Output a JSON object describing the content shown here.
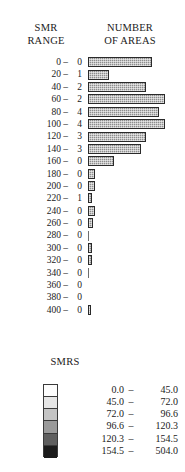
{
  "header": {
    "smr_range_line1": "SMR",
    "smr_range_line2": "RANGE",
    "number_areas_line1": "NUMBER",
    "number_areas_line2": "OF AREAS"
  },
  "legend": {
    "title": "SMRS",
    "entries": [
      {
        "low": "0.0",
        "dash": "–",
        "high": "45.0",
        "color": "#fdfdfd"
      },
      {
        "low": "45.0",
        "dash": "–",
        "high": "72.0",
        "color": "#e6e6e6"
      },
      {
        "low": "72.0",
        "dash": "–",
        "high": "96.6",
        "color": "#c4c4c4"
      },
      {
        "low": "96.6",
        "dash": "–",
        "high": "120.3",
        "color": "#9a9a9a"
      },
      {
        "low": "120.3",
        "dash": "–",
        "high": "154.5",
        "color": "#5f5f5f"
      },
      {
        "low": "154.5",
        "dash": "–",
        "high": "504.0",
        "color": "#1c1c1c"
      }
    ]
  },
  "chart_data": {
    "type": "bar",
    "title": "NUMBER OF AREAS",
    "xlabel": "NUMBER OF AREAS",
    "ylabel": "SMR RANGE",
    "orientation": "horizontal",
    "grid": false,
    "legend_position": "bottom",
    "categories": [
      "0 –",
      "20 –",
      "40 –",
      "60 –",
      "80 –",
      "100 –",
      "120 –",
      "140 –",
      "160 –",
      "180 –",
      "200 –",
      "220 –",
      "240 –",
      "260 –",
      "280 –",
      "300 –",
      "320 –",
      "340 –",
      "360 –",
      "380 –",
      "400 –"
    ],
    "count_labels": [
      "0",
      "1",
      "2",
      "2",
      "4",
      "4",
      "3",
      "3",
      "0",
      "0",
      "0",
      "1",
      "0",
      "0",
      "0",
      "0",
      "0",
      "0",
      "0",
      "0",
      "0"
    ],
    "bar_lengths_px": [
      64,
      21,
      58,
      77,
      71,
      77,
      58,
      53,
      26,
      7,
      7,
      4,
      7,
      5,
      1,
      4,
      4,
      1,
      0,
      0,
      3
    ],
    "rows": [
      {
        "range": "0 –",
        "count": "0",
        "bar_px": 64
      },
      {
        "range": "20 –",
        "count": "1",
        "bar_px": 21
      },
      {
        "range": "40 –",
        "count": "2",
        "bar_px": 58
      },
      {
        "range": "60 –",
        "count": "2",
        "bar_px": 77
      },
      {
        "range": "80 –",
        "count": "4",
        "bar_px": 71
      },
      {
        "range": "100 –",
        "count": "4",
        "bar_px": 77
      },
      {
        "range": "120 –",
        "count": "3",
        "bar_px": 58
      },
      {
        "range": "140 –",
        "count": "3",
        "bar_px": 53
      },
      {
        "range": "160 –",
        "count": "0",
        "bar_px": 26
      },
      {
        "range": "180 –",
        "count": "0",
        "bar_px": 7
      },
      {
        "range": "200 –",
        "count": "0",
        "bar_px": 7
      },
      {
        "range": "220 –",
        "count": "1",
        "bar_px": 4
      },
      {
        "range": "240 –",
        "count": "0",
        "bar_px": 7
      },
      {
        "range": "260 –",
        "count": "0",
        "bar_px": 5
      },
      {
        "range": "280 –",
        "count": "0",
        "bar_px": 1
      },
      {
        "range": "300 –",
        "count": "0",
        "bar_px": 4
      },
      {
        "range": "320 –",
        "count": "0",
        "bar_px": 4
      },
      {
        "range": "340 –",
        "count": "0",
        "bar_px": 1
      },
      {
        "range": "360 –",
        "count": "0",
        "bar_px": 0
      },
      {
        "range": "380 –",
        "count": "0",
        "bar_px": 0
      },
      {
        "range": "400 –",
        "count": "0",
        "bar_px": 3
      }
    ]
  }
}
